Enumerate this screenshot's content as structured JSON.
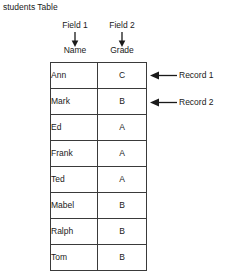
{
  "caption": "students Table",
  "field_annotations": [
    {
      "label": "Field 1",
      "column_name": "Name",
      "arrow": "arrow-down-icon"
    },
    {
      "label": "Field 2",
      "column_name": "Grade",
      "arrow": "arrow-down-icon"
    }
  ],
  "table": {
    "columns": [
      "Name",
      "Grade"
    ],
    "rows": [
      {
        "name": "Ann",
        "grade": "C"
      },
      {
        "name": "Mark",
        "grade": "B"
      },
      {
        "name": "Ed",
        "grade": "A"
      },
      {
        "name": "Frank",
        "grade": "A"
      },
      {
        "name": "Ted",
        "grade": "A"
      },
      {
        "name": "Mabel",
        "grade": "B"
      },
      {
        "name": "Ralph",
        "grade": "B"
      },
      {
        "name": "Tom",
        "grade": "B"
      }
    ]
  },
  "record_annotations": [
    {
      "label": "Record 1",
      "row_index": 0,
      "arrow": "arrow-left-icon"
    },
    {
      "label": "Record 2",
      "row_index": 1,
      "arrow": "arrow-left-icon"
    }
  ],
  "colors": {
    "text": "#1a1a1a",
    "border": "#3a3a3a",
    "background": "#ffffff"
  }
}
